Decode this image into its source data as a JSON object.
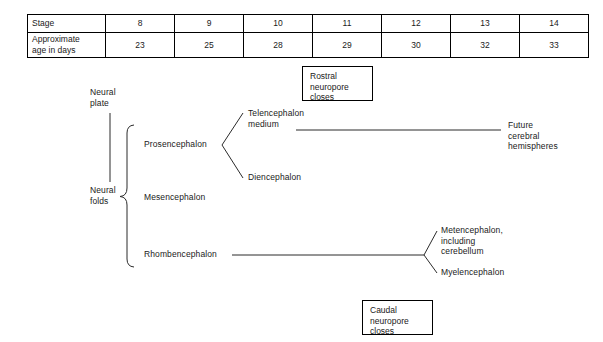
{
  "table": {
    "row_labels": [
      "Stage",
      "Approximate\nage in days"
    ],
    "stages": [
      "8",
      "9",
      "10",
      "11",
      "12",
      "13",
      "14"
    ],
    "ages": [
      "23",
      "25",
      "28",
      "29",
      "30",
      "32",
      "33"
    ]
  },
  "diagram": {
    "origin_label": "Neural\nplate",
    "folds_label": "Neural\nfolds",
    "primary_vesicles": [
      "Prosencephalon",
      "Mesencephalon",
      "Rhombencephalon"
    ],
    "prosencephalon_children": [
      "Telencephalon\nmedium",
      "Diencephalon"
    ],
    "rhombencephalon_children": [
      "Metencephalon,\nincluding\ncerebellum",
      "Myelencephalon"
    ],
    "telencephalon_outcome": "Future\ncerebral\nhemispheres",
    "events": [
      "Rostral\nneuropore\ncloses",
      "Caudal\nneuropore\ncloses"
    ]
  },
  "colors": {
    "background": "#ffffff",
    "ink": "#1a1a1a",
    "stroke": "#2b2b2b",
    "table_border": "#000000"
  }
}
